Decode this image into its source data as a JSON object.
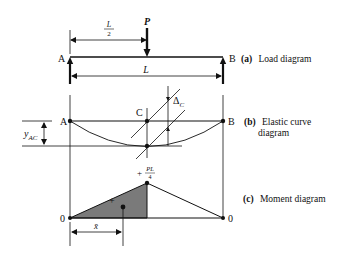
{
  "figure": {
    "load_diagram": {
      "caption_tag": "(a)",
      "caption_text": "Load diagram",
      "support_left": "A",
      "support_right": "B",
      "load_label": "P",
      "half_span_num": "L",
      "half_span_den": "2",
      "span_label": "L"
    },
    "elastic_curve": {
      "caption_tag": "(b)",
      "caption_text_line1": "Elastic curve",
      "caption_text_line2": "diagram",
      "point_left": "A",
      "point_mid": "C",
      "point_right": "B",
      "delta_symbol": "Δ",
      "delta_sub": "C",
      "offset_y": "y",
      "offset_sub": "AC"
    },
    "moment_diagram": {
      "caption_tag": "(c)",
      "caption_text": "Moment diagram",
      "peak_sign": "+",
      "peak_num": "PL",
      "peak_den": "4",
      "left_value": "0",
      "right_value": "0",
      "area_sign": "+",
      "centroid_label": "x̄"
    },
    "colors": {
      "line": "#111111",
      "shaded_area": "#7a7a7a",
      "background": "#ffffff"
    }
  }
}
